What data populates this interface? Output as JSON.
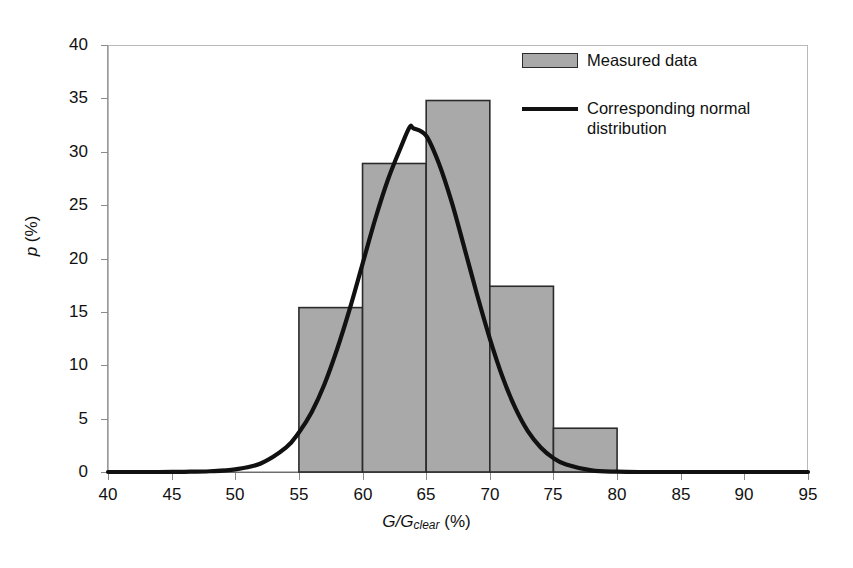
{
  "chart_data": {
    "type": "bar",
    "title": "",
    "subtitle": "",
    "xlabel": "G/G_clear (%)",
    "xlabel_parts": {
      "main": "G/G",
      "sub": "clear",
      "unit": "(%)"
    },
    "ylabel": "p (%)",
    "ylabel_parts": {
      "symbol": "p",
      "unit": "(%)"
    },
    "xlim": [
      40,
      95
    ],
    "ylim": [
      0,
      40
    ],
    "xticks": [
      40,
      45,
      50,
      55,
      60,
      65,
      70,
      75,
      80,
      85,
      90,
      95
    ],
    "yticks": [
      0,
      5,
      10,
      15,
      20,
      25,
      30,
      35,
      40
    ],
    "grid": false,
    "legend_position": "top-right",
    "bin_edges": [
      55,
      60,
      65,
      70,
      75,
      80
    ],
    "categories": [
      "55-60",
      "60-65",
      "65-70",
      "70-75",
      "75-80"
    ],
    "values": [
      15.4,
      28.9,
      34.8,
      17.4,
      4.1
    ],
    "bar_fill": "#a9a9a9",
    "bar_edge": "#2b2b2b",
    "series": [
      {
        "name": "Measured data",
        "type": "bar",
        "bin_edges": [
          55,
          60,
          65,
          70,
          75,
          80
        ],
        "values": [
          15.4,
          28.9,
          34.8,
          17.4,
          4.1
        ]
      },
      {
        "name": "Corresponding normal distribution",
        "type": "line",
        "color": "#111111",
        "peak_x": 63.7,
        "peak_y": 32.3,
        "mean": 63.7,
        "std": 4.55,
        "x": [
          40,
          42,
          44,
          46,
          48,
          50,
          52,
          54,
          55,
          56,
          57,
          58,
          59,
          60,
          61,
          62,
          63,
          63.7,
          64,
          65,
          66,
          67,
          68,
          69,
          70,
          71,
          72,
          73,
          74,
          75,
          76,
          78,
          80,
          82,
          85,
          90,
          95
        ],
        "y": [
          0.0,
          0.0,
          0.0,
          0.02,
          0.07,
          0.25,
          0.8,
          2.3,
          3.7,
          5.6,
          8.2,
          11.5,
          15.3,
          19.5,
          23.7,
          27.4,
          30.4,
          32.3,
          32.2,
          31.5,
          28.9,
          25.3,
          21.0,
          16.6,
          12.5,
          8.9,
          6.0,
          3.8,
          2.3,
          1.3,
          0.7,
          0.15,
          0.03,
          0.0,
          0.0,
          0.0,
          0.0
        ]
      }
    ]
  },
  "legend": {
    "items": [
      {
        "label": "Measured data",
        "marker": "bar-swatch"
      },
      {
        "label": "Corresponding normal\ndistribution",
        "marker": "line-swatch"
      }
    ]
  },
  "axis": {
    "x_tick_labels": [
      "40",
      "45",
      "50",
      "55",
      "60",
      "65",
      "70",
      "75",
      "80",
      "85",
      "90",
      "95"
    ],
    "y_tick_labels": [
      "0",
      "5",
      "10",
      "15",
      "20",
      "25",
      "30",
      "35",
      "40"
    ]
  }
}
